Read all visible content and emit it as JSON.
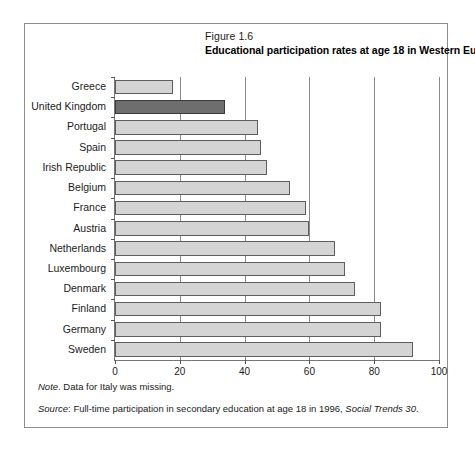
{
  "figure": {
    "number": "Figure 1.6",
    "title": "Educational participation rates at age 18 in Western Europe"
  },
  "footer": {
    "note_label": "Note",
    "note_text": ". Data for Italy was missing.",
    "source_label": "Source",
    "source_text": ": Full-time participation in secondary education at age 18 in 1996, ",
    "source_italic": "Social Trends 30",
    "source_end": "."
  },
  "colors": {
    "bar_fill": "#d4d4d4",
    "bar_stroke": "#5e5e5e",
    "highlight_fill": "#6e6e6e",
    "highlight_stroke": "#3a3a3a",
    "frame": "#8d8d8d",
    "axis": "#777777"
  },
  "chart_data": {
    "type": "bar",
    "orientation": "horizontal",
    "title": "Educational participation rates at age 18 in Western Europe",
    "subtitle": "Figure 1.6",
    "xlabel": "",
    "ylabel": "",
    "xlim": [
      0,
      100
    ],
    "xticks": [
      0,
      20,
      40,
      60,
      80,
      100
    ],
    "xtick_labels": [
      "0",
      "20",
      "40",
      "60",
      "80",
      "100"
    ],
    "grid": true,
    "legend": false,
    "highlight_category": "United Kingdom",
    "categories": [
      "Greece",
      "United Kingdom",
      "Portugal",
      "Spain",
      "Irish Republic",
      "Belgium",
      "France",
      "Austria",
      "Netherlands",
      "Luxembourg",
      "Denmark",
      "Finland",
      "Germany",
      "Sweden"
    ],
    "values": [
      18,
      34,
      44,
      45,
      47,
      54,
      59,
      60,
      68,
      71,
      74,
      82,
      82,
      92
    ]
  }
}
